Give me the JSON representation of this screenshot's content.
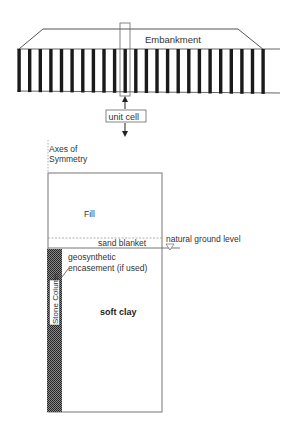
{
  "figure": {
    "type": "unit cell concept for embankment on stone columns",
    "colors": {
      "line": "#555555",
      "column": "#1a1a1a",
      "column_pattern": "#3a3a3a",
      "background": "#ffffff"
    }
  },
  "top_view": {
    "embankment_label": "Embankment",
    "column_count": 24,
    "unit_cell_label": "unit cell"
  },
  "unit_cell_view": {
    "axis_label_line1": "Axes of",
    "axis_label_line2": "Symmetry",
    "fill_label": "Fill",
    "sand_blanket_label": "sand blanket",
    "natural_ground_label": "natural ground level",
    "encasement_label_line1": "geosynthetic",
    "encasement_label_line2": "encasement (if used)",
    "stone_column_label": "Stone Column",
    "soft_clay_label": "soft clay"
  }
}
